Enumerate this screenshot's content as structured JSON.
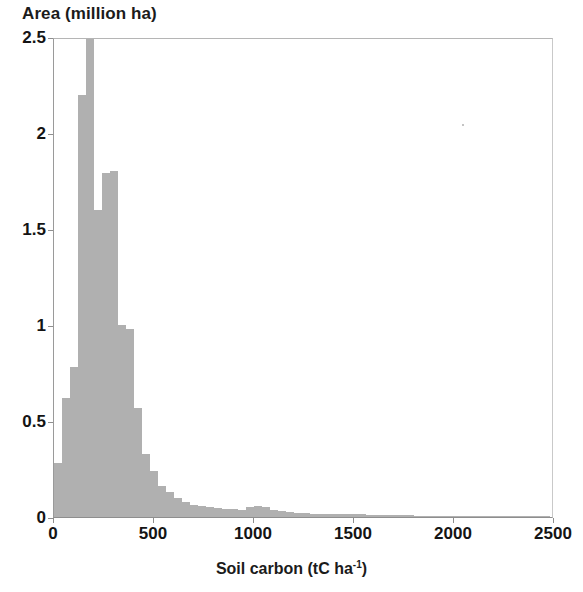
{
  "chart_data": {
    "type": "bar",
    "title": "",
    "ylabel": "Area (million ha)",
    "xlabel": "Soil carbon (tC ha-1)",
    "xlabel_base": "Soil carbon (tC ha",
    "xlabel_sup": "-1",
    "xlabel_tail": ")",
    "xlim": [
      0,
      2500
    ],
    "ylim": [
      0,
      2.5
    ],
    "y_ticks": [
      0,
      0.5,
      1,
      1.5,
      2,
      2.5
    ],
    "y_tick_labels": [
      "0",
      "0.5",
      "1",
      "1.5",
      "2",
      "2.5"
    ],
    "x_ticks": [
      0,
      500,
      1000,
      1500,
      2000,
      2500
    ],
    "x_tick_labels": [
      "0",
      "500",
      "1000",
      "1500",
      "2000",
      "2500"
    ],
    "grid": false,
    "legend": null,
    "bar_color": "#b0b0b0",
    "bin_width": 40,
    "note_clipped_bar": "Bar at bin 160-200 is clipped by the axis top at 2.5",
    "categories": [
      0,
      40,
      80,
      120,
      160,
      200,
      240,
      280,
      320,
      360,
      400,
      440,
      480,
      520,
      560,
      600,
      640,
      680,
      720,
      760,
      800,
      840,
      880,
      920,
      960,
      1000,
      1040,
      1080,
      1120,
      1160,
      1200,
      1240,
      1280,
      1320,
      1360,
      1400,
      1440,
      1480,
      1520,
      1560,
      1600,
      1640,
      1680,
      1720,
      1760,
      1800,
      1840,
      1880,
      1920,
      1960,
      2000,
      2040,
      2080,
      2120,
      2160,
      2200,
      2240,
      2280,
      2320,
      2360,
      2400,
      2440
    ],
    "values": [
      0.28,
      0.62,
      0.78,
      2.2,
      2.62,
      1.6,
      1.79,
      1.8,
      1.0,
      0.98,
      0.57,
      0.33,
      0.24,
      0.16,
      0.13,
      0.1,
      0.08,
      0.065,
      0.055,
      0.05,
      0.045,
      0.04,
      0.04,
      0.038,
      0.05,
      0.055,
      0.05,
      0.038,
      0.03,
      0.025,
      0.022,
      0.02,
      0.018,
      0.016,
      0.015,
      0.016,
      0.018,
      0.016,
      0.014,
      0.012,
      0.011,
      0.01,
      0.009,
      0.008,
      0.008,
      0.007,
      0.006,
      0.006,
      0.005,
      0.005,
      0.004,
      0.004,
      0.004,
      0.003,
      0.003,
      0.003,
      0.002,
      0.002,
      0.002,
      0.002,
      0.002,
      0.002
    ]
  }
}
